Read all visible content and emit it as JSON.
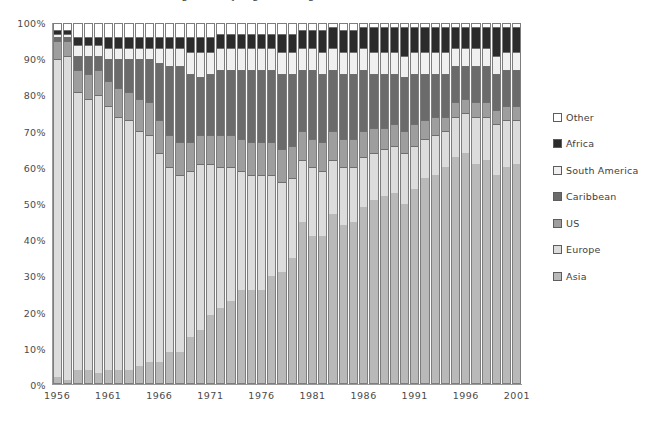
{
  "chart_data": {
    "type": "bar",
    "subtype": "stacked-100-percent",
    "title": "Immigration by region of origin, 1956-2001",
    "xlabel": "",
    "ylabel": "",
    "ylim": [
      0,
      100
    ],
    "ytick_labels": [
      "0%",
      "10%",
      "20%",
      "30%",
      "40%",
      "50%",
      "60%",
      "70%",
      "80%",
      "90%",
      "100%"
    ],
    "ytick_values": [
      0,
      10,
      20,
      30,
      40,
      50,
      60,
      70,
      80,
      90,
      100
    ],
    "grid": false,
    "legend_position": "right",
    "legend_order": [
      "Other",
      "Africa",
      "South America",
      "Caribbean",
      "US",
      "Europe",
      "Asia"
    ],
    "stack_order_bottom_to_top": [
      "Asia",
      "Europe",
      "US",
      "Caribbean",
      "South America",
      "Africa",
      "Other"
    ],
    "categories": [
      "1956",
      "1957",
      "1958",
      "1959",
      "1960",
      "1961",
      "1962",
      "1963",
      "1964",
      "1965",
      "1966",
      "1967",
      "1968",
      "1969",
      "1970",
      "1971",
      "1972",
      "1973",
      "1974",
      "1975",
      "1976",
      "1977",
      "1978",
      "1979",
      "1980",
      "1981",
      "1982",
      "1983",
      "1984",
      "1985",
      "1986",
      "1987",
      "1988",
      "1989",
      "1990",
      "1991",
      "1992",
      "1993",
      "1994",
      "1995",
      "1996",
      "1997",
      "1998",
      "1999",
      "2000",
      "2001"
    ],
    "xtick_labels": [
      "1956",
      "1961",
      "1966",
      "1971",
      "1976",
      "1981",
      "1986",
      "1991",
      "1996",
      "2001"
    ],
    "series": [
      {
        "name": "Asia",
        "color": "#b9b9b9",
        "values": [
          2,
          1,
          4,
          4,
          3,
          4,
          4,
          4,
          5,
          6,
          6,
          9,
          9,
          13,
          15,
          19,
          21,
          23,
          26,
          26,
          26,
          30,
          31,
          35,
          45,
          41,
          41,
          47,
          44,
          45,
          49,
          51,
          52,
          53,
          50,
          54,
          57,
          58,
          60,
          63,
          64,
          61,
          62,
          58,
          60,
          61
        ]
      },
      {
        "name": "Europe",
        "color": "#dcdcdc",
        "values": [
          88,
          90,
          77,
          75,
          77,
          73,
          70,
          69,
          65,
          63,
          58,
          51,
          49,
          46,
          46,
          42,
          39,
          37,
          33,
          32,
          32,
          28,
          25,
          22,
          17,
          19,
          18,
          15,
          16,
          15,
          14,
          13,
          13,
          13,
          14,
          12,
          11,
          11,
          10,
          11,
          11,
          13,
          12,
          14,
          13,
          12
        ]
      },
      {
        "name": "US",
        "color": "#9e9e9e",
        "values": [
          5,
          4,
          6,
          7,
          7,
          7,
          8,
          8,
          9,
          9,
          9,
          9,
          9,
          8,
          8,
          8,
          9,
          9,
          9,
          9,
          9,
          9,
          9,
          9,
          8,
          8,
          8,
          8,
          8,
          8,
          7,
          7,
          6,
          6,
          6,
          6,
          5,
          5,
          4,
          4,
          4,
          4,
          4,
          4,
          4,
          4
        ]
      },
      {
        "name": "Caribbean",
        "color": "#6b6b6b",
        "values": [
          1,
          1,
          4,
          5,
          4,
          6,
          8,
          9,
          11,
          12,
          16,
          19,
          21,
          19,
          16,
          17,
          18,
          18,
          19,
          20,
          20,
          20,
          21,
          20,
          17,
          19,
          19,
          17,
          18,
          18,
          17,
          15,
          15,
          14,
          15,
          14,
          13,
          12,
          12,
          10,
          9,
          10,
          10,
          10,
          10,
          10
        ]
      },
      {
        "name": "South America",
        "color": "#f0f0f0",
        "values": [
          1,
          1,
          3,
          3,
          3,
          3,
          3,
          3,
          3,
          3,
          4,
          5,
          5,
          6,
          7,
          6,
          6,
          6,
          6,
          6,
          6,
          6,
          6,
          6,
          6,
          6,
          6,
          6,
          6,
          6,
          6,
          6,
          6,
          6,
          6,
          6,
          6,
          6,
          6,
          5,
          5,
          5,
          5,
          5,
          5,
          5
        ]
      },
      {
        "name": "Africa",
        "color": "#2b2b2b",
        "values": [
          1,
          1,
          2,
          2,
          2,
          3,
          3,
          3,
          3,
          3,
          3,
          3,
          3,
          4,
          4,
          4,
          4,
          4,
          4,
          4,
          4,
          4,
          5,
          5,
          5,
          5,
          6,
          6,
          6,
          6,
          6,
          7,
          7,
          7,
          8,
          7,
          7,
          7,
          7,
          6,
          6,
          6,
          6,
          8,
          7,
          7
        ]
      },
      {
        "name": "Other",
        "color": "#ffffff",
        "values": [
          2,
          2,
          4,
          4,
          4,
          4,
          4,
          4,
          4,
          4,
          4,
          4,
          4,
          4,
          4,
          4,
          3,
          3,
          3,
          3,
          3,
          3,
          3,
          3,
          2,
          2,
          2,
          1,
          2,
          2,
          1,
          1,
          1,
          1,
          1,
          1,
          1,
          1,
          1,
          1,
          1,
          1,
          1,
          1,
          1,
          1
        ]
      }
    ]
  }
}
